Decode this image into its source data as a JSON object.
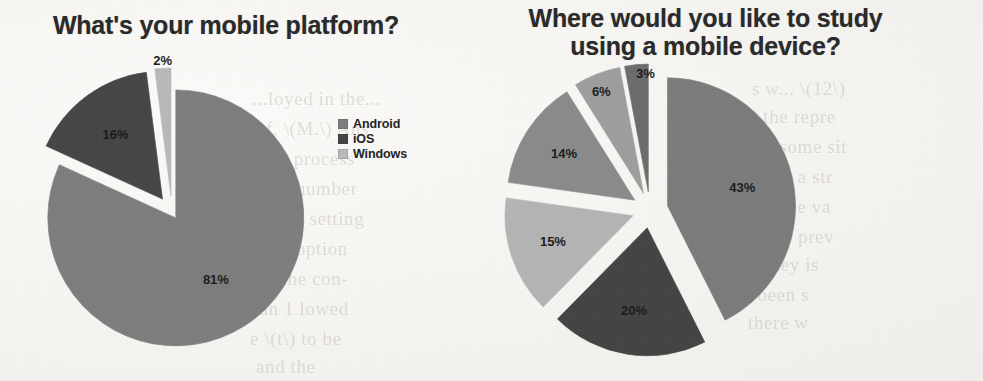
{
  "page": {
    "background_color": "#f7f6f3",
    "ghost_text_color": "#b9b4ac",
    "ghost_lines": [
      {
        "text": "...loyed in the...",
        "x": 252,
        "y": 88
      },
      {
        "text": "of. \\(M.\\) Ans",
        "x": 256,
        "y": 118
      },
      {
        "text": "s the process",
        "x": 250,
        "y": 148
      },
      {
        "text": "with a number",
        "x": 240,
        "y": 178
      },
      {
        "text": "nicious setting",
        "x": 245,
        "y": 208
      },
      {
        "text": "o the option",
        "x": 250,
        "y": 238
      },
      {
        "text": "ple, the con-",
        "x": 246,
        "y": 268
      },
      {
        "text": "n an 1 lowed",
        "x": 244,
        "y": 298
      },
      {
        "text": "e \\(t\\) to be",
        "x": 250,
        "y": 328
      },
      {
        "text": "and the",
        "x": 256,
        "y": 356
      },
      {
        "text": "s w...  \\(12\\)",
        "x": 752,
        "y": 78
      },
      {
        "text": "ly the repre",
        "x": 742,
        "y": 106
      },
      {
        "text": "...o some sit",
        "x": 748,
        "y": 136
      },
      {
        "text": "opi in a str",
        "x": 745,
        "y": 166
      },
      {
        "text": "...ns the va",
        "x": 742,
        "y": 196
      },
      {
        "text": "w the prev",
        "x": 748,
        "y": 226
      },
      {
        "text": "e, they is",
        "x": 745,
        "y": 254
      },
      {
        "text": "d been s",
        "x": 742,
        "y": 284
      },
      {
        "text": "there w",
        "x": 748,
        "y": 312
      }
    ]
  },
  "charts": [
    {
      "id": "mobile-platform",
      "title": "What's your mobile platform?",
      "legend_position": "right",
      "chart_data": {
        "type": "pie",
        "title": "What's your mobile platform?",
        "xlabel": "",
        "ylabel": "",
        "unit": "%",
        "categories": [
          "Android",
          "iOS",
          "Windows"
        ],
        "values": [
          81,
          16,
          2
        ],
        "labels": [
          "81%",
          "16%",
          "2%"
        ],
        "colors": [
          "#7e7e7e",
          "#474747",
          "#b9b9b9"
        ],
        "exploded": true,
        "start_angle_deg": 0,
        "legend": [
          "Android",
          "iOS",
          "Windows"
        ]
      },
      "geometry": {
        "cx": 172,
        "cy": 212,
        "r": 128,
        "explode": [
          7,
          16,
          16
        ],
        "label_radius_frac": [
          0.58,
          0.62,
          1.02
        ],
        "label_offsets": [
          [
            0,
            0
          ],
          [
            0,
            0
          ],
          [
            0,
            -4
          ]
        ]
      }
    },
    {
      "id": "study-location",
      "title": "Where would you like to study using a mobile device?",
      "title_lines": [
        "Where would you like to study",
        "using a mobile device?"
      ],
      "legend_position": "right",
      "chart_data": {
        "type": "pie",
        "title": "Where would you like to study using a mobile device?",
        "xlabel": "",
        "ylabel": "",
        "unit": "%",
        "categories": [
          "Home",
          "Other palces",
          "Anywhere with wifi",
          "Office",
          "School",
          "Neither"
        ],
        "values": [
          43,
          20,
          15,
          14,
          6,
          3
        ],
        "labels": [
          "43%",
          "20%",
          "15%",
          "14%",
          "6%",
          "3%"
        ],
        "colors": [
          "#7c7c7c",
          "#454545",
          "#b4b4b4",
          "#8b8b8b",
          "#9e9e9e",
          "#6d6d6d"
        ],
        "exploded": true,
        "start_angle_deg": 0,
        "legend": [
          "Home",
          "Other palces",
          "Anywhere with wifi",
          "Office",
          "School",
          "Neither"
        ]
      },
      "geometry": {
        "cx": 160,
        "cy": 210,
        "r": 128,
        "explode": [
          18,
          18,
          18,
          18,
          18,
          18
        ],
        "label_radius_frac": [
          0.6,
          0.66,
          0.66,
          0.66,
          0.86,
          0.92
        ],
        "label_offsets": [
          [
            0,
            0
          ],
          [
            0,
            0
          ],
          [
            0,
            0
          ],
          [
            0,
            0
          ],
          [
            -2,
            2
          ],
          [
            8,
            0
          ]
        ]
      }
    }
  ]
}
